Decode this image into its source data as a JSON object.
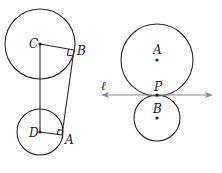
{
  "colors": {
    "stroke": "#2a2a2a",
    "line_l": "#888888",
    "background": "#ffffff"
  },
  "left_figure": {
    "circle_C": {
      "label": "C",
      "cx": 40,
      "cy": 44,
      "r": 35
    },
    "circle_D": {
      "label": "D",
      "cx": 40,
      "cy": 132,
      "r": 23
    },
    "point_B": {
      "label": "B",
      "x": 74,
      "y": 50
    },
    "point_A": {
      "label": "A",
      "x": 62,
      "y": 135
    }
  },
  "right_figure": {
    "circle_A": {
      "label": "A",
      "cx": 157,
      "cy": 60,
      "r": 36
    },
    "circle_B": {
      "label": "B",
      "cx": 157,
      "cy": 118,
      "r": 23
    },
    "point_P": {
      "label": "P",
      "x": 157,
      "y": 95
    },
    "line_l": {
      "label": "ℓ",
      "x1": 101,
      "x2": 212,
      "y": 95
    }
  }
}
